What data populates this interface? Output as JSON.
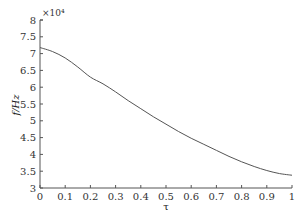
{
  "chart_data": {
    "type": "line",
    "title": "",
    "xlabel": "τ",
    "ylabel": "f/Hz",
    "y_scale_annotation": "×10⁴",
    "y_multiplier": 10000,
    "xlim": [
      0,
      1
    ],
    "ylim": [
      3,
      8
    ],
    "grid": false,
    "legend": null,
    "x_ticks": [
      0,
      0.1,
      0.2,
      0.3,
      0.4,
      0.5,
      0.6,
      0.7,
      0.8,
      0.9,
      1
    ],
    "x_tick_labels": [
      "0",
      "0.1",
      "0.2",
      "0.3",
      "0.4",
      "0.5",
      "0.6",
      "0.7",
      "0.8",
      "0.9",
      "1"
    ],
    "y_ticks": [
      3,
      3.5,
      4,
      4.5,
      5,
      5.5,
      6,
      6.5,
      7,
      7.5,
      8
    ],
    "y_tick_labels": [
      "3",
      "3.5",
      "4",
      "4.5",
      "5",
      "5.5",
      "6",
      "6.5",
      "7",
      "7.5",
      "8"
    ],
    "series": [
      {
        "name": "f",
        "color": "#555555",
        "x": [
          0,
          0.05,
          0.1,
          0.15,
          0.2,
          0.25,
          0.3,
          0.35,
          0.4,
          0.45,
          0.5,
          0.55,
          0.6,
          0.65,
          0.7,
          0.75,
          0.8,
          0.85,
          0.9,
          0.95,
          1
        ],
        "values": [
          7.18,
          7.06,
          6.87,
          6.6,
          6.3,
          6.1,
          5.86,
          5.6,
          5.36,
          5.12,
          4.9,
          4.68,
          4.48,
          4.3,
          4.12,
          3.94,
          3.78,
          3.64,
          3.52,
          3.43,
          3.38
        ]
      }
    ]
  }
}
